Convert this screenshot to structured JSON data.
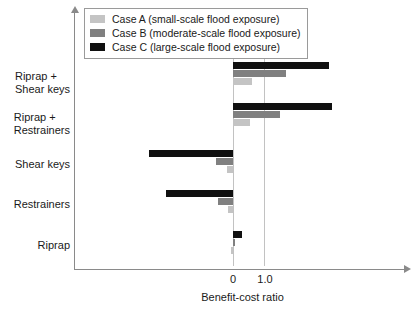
{
  "chart_data": {
    "type": "bar",
    "orientation": "horizontal",
    "title": "",
    "xlabel": "Benefit-cost ratio",
    "ylabel": "",
    "xlim": [
      -3.3,
      3.6
    ],
    "xticks": [
      0,
      1.0
    ],
    "xticklabels": [
      "0",
      "1.0"
    ],
    "grid": true,
    "gridlines_at": [
      0,
      1.0
    ],
    "legend_position": "top-left",
    "categories": [
      "Riprap",
      "Restrainers",
      "Shear keys",
      "Riprap + Restrainers",
      "Riprap + Shear keys"
    ],
    "category_labels": [
      [
        "Riprap"
      ],
      [
        "Restrainers"
      ],
      [
        "Shear keys"
      ],
      [
        "Riprap +",
        "Restrainers"
      ],
      [
        "Riprap +",
        "Shear keys"
      ]
    ],
    "series": [
      {
        "name": "Case A (small-scale flood exposure)",
        "short": "Case A",
        "color": "#c4c4c4",
        "values": [
          -0.05,
          -0.15,
          -0.2,
          0.55,
          0.6
        ]
      },
      {
        "name": "Case B (moderate-scale flood exposure)",
        "short": "Case B",
        "color": "#808080",
        "values": [
          0.08,
          -0.5,
          -0.55,
          1.5,
          1.7
        ]
      },
      {
        "name": "Case C (large-scale flood exposure)",
        "short": "Case C",
        "color": "#101010",
        "values": [
          0.28,
          -2.15,
          -2.7,
          3.2,
          3.1
        ]
      }
    ]
  },
  "legend": {
    "items": [
      {
        "label": "Case A (small-scale flood exposure)",
        "color": "#c4c4c4"
      },
      {
        "label": "Case B (moderate-scale flood exposure)",
        "color": "#808080"
      },
      {
        "label": "Case C (large-scale flood exposure)",
        "color": "#101010"
      }
    ]
  },
  "axis": {
    "x_title": "Benefit-cost ratio",
    "tick_0": "0",
    "tick_1": "1.0"
  },
  "colors": {
    "case_a": "#c4c4c4",
    "case_b": "#808080",
    "case_c": "#101010",
    "axis": "#8a8a8a",
    "gridline": "#c2c2c2",
    "background": "#ffffff"
  }
}
